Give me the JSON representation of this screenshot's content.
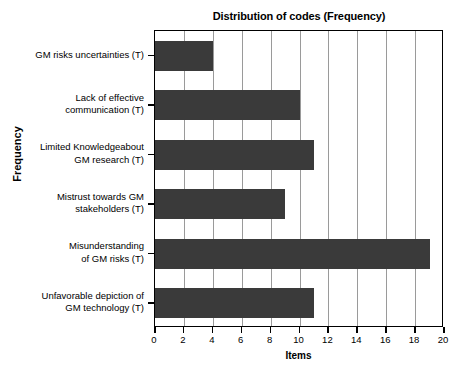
{
  "chart_data": {
    "type": "bar",
    "orientation": "horizontal",
    "title": "Distribution of codes (Frequency)",
    "xlabel": "Items",
    "ylabel": "Frequency",
    "categories": [
      "GM risks uncertainties (T)",
      "Lack of effective communication (T)",
      "Limited Knowledgeabout GM research (T)",
      "Mistrust towards GM stakeholders (T)",
      "Misunderstanding of GM risks (T)",
      "Unfavorable depiction of GM technology (T)"
    ],
    "category_lines": [
      [
        "GM risks uncertainties (T)"
      ],
      [
        "Lack of effective",
        "communication (T)"
      ],
      [
        "Limited Knowledgeabout",
        "GM research (T)"
      ],
      [
        "Mistrust towards GM",
        "stakeholders (T)"
      ],
      [
        "Misunderstanding",
        "of GM risks (T)"
      ],
      [
        "Unfavorable depiction of",
        "GM technology (T)"
      ]
    ],
    "values": [
      4,
      10,
      11,
      9,
      19,
      11
    ],
    "xlim": [
      0,
      20
    ],
    "xticks": [
      0,
      2,
      4,
      6,
      8,
      10,
      12,
      14,
      16,
      18,
      20
    ],
    "xtick_labels": [
      "0",
      "2",
      "4",
      "6",
      "8",
      "10",
      "12",
      "14",
      "16",
      "18",
      "20"
    ],
    "grid": "vertical-major",
    "legend": "none",
    "bar_color": "#3a3a3a",
    "grid_color": "#9a9a9a",
    "axis_color": "#000000",
    "background_color": "#ffffff"
  }
}
